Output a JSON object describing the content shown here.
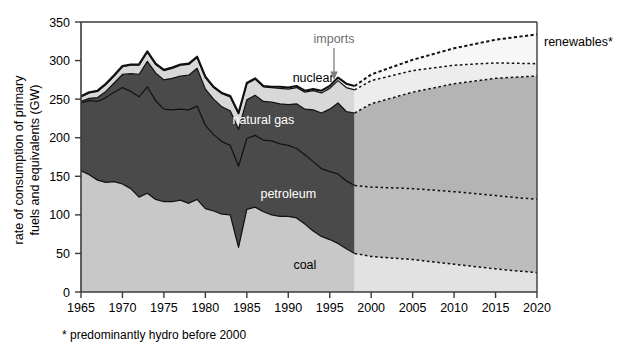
{
  "chart_data": {
    "type": "area",
    "stacked": true,
    "title": "",
    "xlabel": "",
    "ylabel": "rate of consumption of primary fuels and equivalents (GW)",
    "xlim": [
      1965,
      2020
    ],
    "ylim": [
      0,
      350
    ],
    "yticks": [
      0,
      50,
      100,
      150,
      200,
      250,
      300,
      350
    ],
    "xticks": [
      1965,
      1970,
      1975,
      1980,
      1985,
      1990,
      1995,
      2000,
      2005,
      2010,
      2015,
      2020
    ],
    "grid": false,
    "legend": "inline-labels",
    "projection_starts": 1998,
    "footnote": "* predominantly hydro before 2000",
    "annotations": [
      {
        "text": "imports",
        "x": 1994,
        "y": 300,
        "color": "#6e6e6e",
        "arrow": true
      },
      {
        "text": "renewables*",
        "x": 2021,
        "y": 318,
        "color": "#000000",
        "arrow": false
      }
    ],
    "inline_labels": [
      {
        "text": "nuclear",
        "x": 1993,
        "y": 272,
        "color": "#000000"
      },
      {
        "text": "natural gas",
        "x": 1987,
        "y": 218,
        "color": "#ffffff"
      },
      {
        "text": "petroleum",
        "x": 1990,
        "y": 122,
        "color": "#ffffff"
      },
      {
        "text": "coal",
        "x": 1992,
        "y": 30,
        "color": "#000000"
      }
    ],
    "x": [
      1965,
      1966,
      1967,
      1968,
      1969,
      1970,
      1971,
      1972,
      1973,
      1974,
      1975,
      1976,
      1977,
      1978,
      1979,
      1980,
      1981,
      1982,
      1983,
      1984,
      1985,
      1986,
      1987,
      1988,
      1989,
      1990,
      1991,
      1992,
      1993,
      1994,
      1995,
      1996,
      1997,
      1998,
      2000,
      2005,
      2010,
      2015,
      2020
    ],
    "series": [
      {
        "name": "coal",
        "color": "#c8c8c8",
        "projection_color": "#e2e2e2",
        "values": [
          157,
          152,
          145,
          142,
          143,
          140,
          134,
          123,
          128,
          120,
          117,
          117,
          119,
          115,
          120,
          108,
          105,
          101,
          100,
          58,
          107,
          110,
          104,
          100,
          98,
          98,
          96,
          88,
          79,
          72,
          68,
          63,
          56,
          50,
          46,
          42,
          36,
          30,
          25
        ]
      },
      {
        "name": "petroleum",
        "color": "#4a4a4a",
        "projection_color": "#bdbdbd",
        "values": [
          88,
          96,
          102,
          110,
          116,
          125,
          126,
          130,
          138,
          128,
          120,
          119,
          118,
          121,
          121,
          108,
          99,
          94,
          90,
          105,
          92,
          93,
          93,
          96,
          94,
          92,
          90,
          90,
          90,
          88,
          88,
          90,
          88,
          88,
          90,
          92,
          94,
          95,
          95
        ]
      },
      {
        "name": "natural gas",
        "color": "#4a4a4a",
        "projection_color": "#b4b4b4",
        "values": [
          2,
          3,
          5,
          8,
          12,
          17,
          23,
          29,
          33,
          36,
          38,
          41,
          43,
          45,
          49,
          47,
          46,
          45,
          45,
          48,
          50,
          52,
          50,
          50,
          52,
          53,
          58,
          59,
          67,
          72,
          81,
          92,
          90,
          94,
          108,
          125,
          140,
          152,
          160
        ]
      },
      {
        "name": "nuclear",
        "color": "#d8d8d8",
        "projection_color": "#ededed",
        "values": [
          6,
          7,
          8,
          9,
          9,
          10,
          11,
          12,
          12,
          11,
          12,
          13,
          14,
          14,
          14,
          15,
          15,
          17,
          18,
          20,
          21,
          21,
          19,
          19,
          20,
          20,
          21,
          22,
          25,
          26,
          27,
          29,
          31,
          30,
          30,
          28,
          24,
          20,
          16
        ]
      },
      {
        "name": "renewables",
        "color": "#f2f2f2",
        "projection_color": "#f7f7f7",
        "values": [
          1,
          1,
          1,
          1,
          1,
          1,
          1,
          1,
          1,
          1,
          1,
          1,
          1,
          1,
          1,
          1,
          1,
          1,
          1,
          1,
          1,
          1,
          1,
          1,
          2,
          2,
          2,
          2,
          2,
          3,
          3,
          4,
          5,
          5,
          8,
          14,
          22,
          30,
          38
        ]
      }
    ],
    "totals": [
      254,
      259,
      261,
      270,
      281,
      293,
      295,
      295,
      312,
      296,
      288,
      291,
      295,
      296,
      305,
      279,
      266,
      258,
      254,
      232,
      271,
      277,
      267,
      265,
      266,
      265,
      267,
      261,
      263,
      261,
      267,
      278,
      270,
      267,
      282,
      301,
      316,
      327,
      334
    ]
  },
  "footer": {
    "note": "* predominantly hydro before 2000"
  }
}
